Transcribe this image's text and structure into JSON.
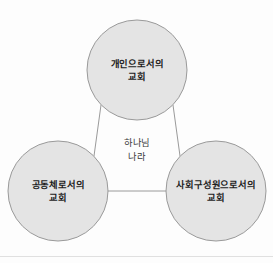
{
  "diagram": {
    "type": "venn-triad-relationship",
    "background_color": "#fdfdfd",
    "circle_fill": "#e4e4e4",
    "circle_stroke": "#9a9a9a",
    "connector_color": "#9a9a9a",
    "label_color": "#1c1c1c",
    "center_label_color": "#3a3a3a",
    "nodes": [
      {
        "id": "individual-church",
        "line1": "개인으로서의",
        "line2": "교회",
        "cx": 137,
        "cy": 70,
        "r": 50
      },
      {
        "id": "community-church",
        "line1": "공동체로서의",
        "line2": "교회",
        "cx": 58,
        "cy": 191,
        "r": 50
      },
      {
        "id": "social-member-church",
        "line1": "사회구성원으로서의",
        "line2": "교회",
        "cx": 216,
        "cy": 191,
        "r": 50
      }
    ],
    "center": {
      "id": "kingdom-of-god",
      "line1": "하나님",
      "line2": "나라",
      "cx": 137,
      "cy": 150
    },
    "connectors": [
      {
        "id": "top-to-left",
        "x1": 101,
        "y1": 105,
        "x2": 94,
        "y2": 156
      },
      {
        "id": "top-to-right",
        "x1": 173,
        "y1": 105,
        "x2": 180,
        "y2": 156
      },
      {
        "id": "left-to-right",
        "x1": 108,
        "y1": 191,
        "x2": 166,
        "y2": 191
      }
    ],
    "divider": {
      "id": "bottom-divider",
      "y": 256,
      "color": "#e0e0e0"
    }
  }
}
